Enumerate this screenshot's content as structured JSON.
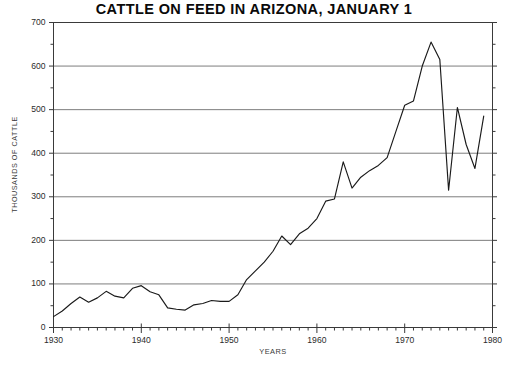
{
  "chart_data": {
    "type": "line",
    "title": "CATTLE ON FEED IN ARIZONA, JANUARY 1",
    "xlabel": "YEARS",
    "ylabel": "THOUSANDS OF CATTLE",
    "xlim": [
      1930,
      1980
    ],
    "ylim": [
      0,
      700
    ],
    "grid": "horizontal-major",
    "legend": "none",
    "x_major_ticks": [
      1930,
      1940,
      1950,
      1960,
      1970,
      1980
    ],
    "x_major_tick_labels": [
      "1930",
      "1940",
      "1950",
      "1960",
      "1970",
      "1980"
    ],
    "x_minor_tick_step": 1,
    "y_major_ticks": [
      0,
      100,
      200,
      300,
      400,
      500,
      600,
      700
    ],
    "y_major_tick_labels": [
      "0",
      "100",
      "200",
      "300",
      "400",
      "500",
      "600",
      "700"
    ],
    "y_minor_tick_step": 50,
    "series": [
      {
        "name": "Cattle on feed",
        "color": "#1a1a1a",
        "x": [
          1930,
          1931,
          1932,
          1933,
          1934,
          1935,
          1936,
          1937,
          1938,
          1939,
          1940,
          1941,
          1942,
          1943,
          1944,
          1945,
          1946,
          1947,
          1948,
          1949,
          1950,
          1951,
          1952,
          1953,
          1954,
          1955,
          1956,
          1957,
          1958,
          1959,
          1960,
          1961,
          1962,
          1963,
          1964,
          1965,
          1966,
          1967,
          1968,
          1969,
          1970,
          1971,
          1972,
          1973,
          1974,
          1975,
          1976,
          1977,
          1978,
          1979
        ],
        "values": [
          25,
          38,
          55,
          70,
          58,
          68,
          83,
          72,
          68,
          90,
          96,
          82,
          75,
          45,
          42,
          40,
          52,
          55,
          62,
          60,
          60,
          75,
          110,
          130,
          150,
          175,
          210,
          190,
          215,
          228,
          250,
          290,
          295,
          380,
          320,
          345,
          360,
          372,
          390,
          450,
          510,
          520,
          600,
          655,
          615,
          315,
          505,
          420,
          365,
          485
        ]
      }
    ]
  },
  "axes": {
    "y_tick_values": [
      "700",
      "600",
      "500",
      "400",
      "300",
      "200",
      "100",
      "0"
    ],
    "x_tick_values": [
      "1930",
      "1940",
      "1950",
      "1960",
      "1970",
      "1980"
    ]
  },
  "style": {
    "line_color": "#1a1a1a",
    "grid_color": "#6e6e6e",
    "frame_color": "#3a3a3a",
    "background": "#ffffff"
  }
}
